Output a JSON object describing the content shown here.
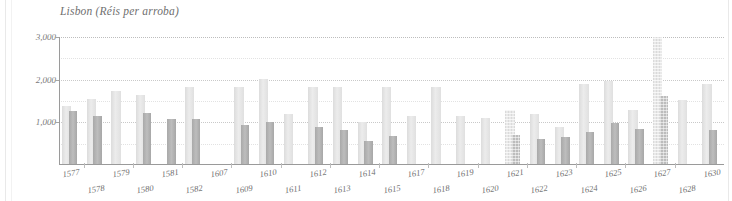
{
  "chart_data": {
    "type": "bar",
    "title": "Lisbon (Réis per arroba)",
    "xlabel": "",
    "ylabel": "",
    "ylim": [
      0,
      3000
    ],
    "yticks": [
      "1,000",
      "2,000",
      "3,000"
    ],
    "ytick_values": [
      1000,
      2000,
      3000
    ],
    "grid": true,
    "legend": "none",
    "categories": [
      "1577",
      "1578",
      "1579",
      "1580",
      "1581",
      "1582",
      "1607",
      "1609",
      "1610",
      "1611",
      "1612",
      "1613",
      "1614",
      "1615",
      "1617",
      "1618",
      "1619",
      "1620",
      "1621",
      "1622",
      "1623",
      "1624",
      "1625",
      "1626",
      "1627",
      "1628",
      "1630"
    ],
    "series": [
      {
        "name": "high",
        "values": [
          1390,
          1540,
          1730,
          1640,
          null,
          1840,
          null,
          1840,
          2020,
          1190,
          1840,
          1840,
          1010,
          1840,
          1140,
          1840,
          1150,
          1110,
          1300,
          1200,
          880,
          1890,
          1960,
          1290,
          3000,
          1530,
          1890
        ]
      },
      {
        "name": "low",
        "values": [
          1260,
          1140,
          null,
          1210,
          1070,
          1080,
          null,
          940,
          1010,
          null,
          900,
          820,
          560,
          690,
          null,
          null,
          null,
          null,
          700,
          620,
          650,
          780,
          980,
          850,
          1620,
          null,
          810
        ]
      }
    ]
  },
  "chart_meta": {
    "bar_colors": {
      "high": "#e4e4e4",
      "low": "#b4b4b4"
    },
    "axis_color": "#9a9a9a",
    "grid_color": "#c9c9c9",
    "text_color": "#6f6f6f",
    "textured_categories": [
      "1621",
      "1627"
    ]
  }
}
